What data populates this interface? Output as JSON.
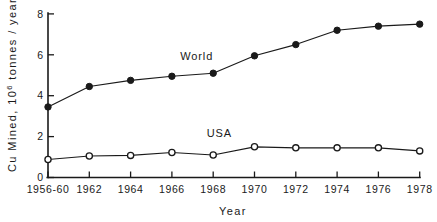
{
  "chart_data": {
    "type": "line",
    "title": "",
    "subtitle": "",
    "xlabel": "Year",
    "ylabel": "Cu Mined, 10⁶ tonnes / year",
    "ylabel_parts": {
      "lead": "Cu Mined, 10",
      "exponent": "6",
      "trail": " tonnes / year"
    },
    "categories": [
      "1956-60",
      "1962",
      "1964",
      "1966",
      "1968",
      "1970",
      "1972",
      "1974",
      "1976",
      "1978"
    ],
    "x": [
      1958,
      1962,
      1964,
      1966,
      1968,
      1970,
      1972,
      1974,
      1976,
      1978
    ],
    "xtick_labels": [
      "1956-60",
      "1962",
      "1964",
      "1966",
      "1968",
      "1970",
      "1972",
      "1974",
      "1976",
      "1978"
    ],
    "ytick_labels": [
      "0",
      "2",
      "4",
      "6",
      "8"
    ],
    "ytick_values": [
      0,
      2,
      4,
      6,
      8
    ],
    "ylim": [
      0,
      8
    ],
    "xlim_index": [
      0,
      9
    ],
    "grid": false,
    "legend_position": "inline-annotation",
    "series": [
      {
        "name": "World",
        "marker": "filled-circle",
        "label_text": "World",
        "values": [
          3.45,
          4.45,
          4.75,
          4.95,
          5.1,
          5.95,
          6.5,
          7.2,
          7.4,
          7.5
        ]
      },
      {
        "name": "USA",
        "marker": "open-circle",
        "label_text": "USA",
        "values": [
          0.88,
          1.05,
          1.08,
          1.22,
          1.1,
          1.5,
          1.45,
          1.45,
          1.45,
          1.3
        ]
      }
    ],
    "annotations": [
      {
        "text": "World",
        "series": "World",
        "x_index": 3.6,
        "y_value": 5.75
      },
      {
        "text": "USA",
        "series": "USA",
        "x_index": 4.15,
        "y_value": 2.0
      }
    ],
    "colors": {
      "ink": "#1a1a1a",
      "background": "#ffffff",
      "marker_fill_world": "#1a1a1a",
      "marker_fill_usa": "#ffffff"
    }
  }
}
